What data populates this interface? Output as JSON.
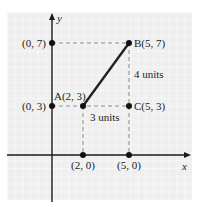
{
  "diagram": {
    "type": "coordinate-plane",
    "axes": {
      "x_label": "x",
      "y_label": "y"
    },
    "points": [
      {
        "id": "A",
        "label": "A(2, 3)",
        "x": 2,
        "y": 3
      },
      {
        "id": "B",
        "label": "B(5, 7)",
        "x": 5,
        "y": 7
      },
      {
        "id": "C",
        "label": "C(5, 3)",
        "x": 5,
        "y": 3
      },
      {
        "id": "y7",
        "label": "(0, 7)",
        "x": 0,
        "y": 7
      },
      {
        "id": "y3",
        "label": "(0, 3)",
        "x": 0,
        "y": 3
      },
      {
        "id": "x2",
        "label": "(2, 0)",
        "x": 2,
        "y": 0
      },
      {
        "id": "x5",
        "label": "(5, 0)",
        "x": 5,
        "y": 0
      }
    ],
    "segments": [
      {
        "from": "A",
        "to": "B",
        "style": "solid"
      }
    ],
    "annotations": {
      "horizontal_distance": "3 units",
      "vertical_distance": "4 units"
    },
    "colors": {
      "panel": "#efefef",
      "grid": "#ffffff",
      "axis": "#1a1a1a",
      "dash": "#888888",
      "segment": "#222222"
    }
  }
}
